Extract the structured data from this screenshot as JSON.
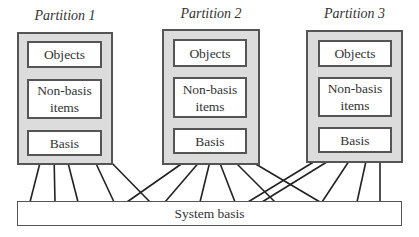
{
  "partitions": [
    {
      "title": "Partition 1",
      "objects": "Objects",
      "nonbasis": "Non-basis items",
      "basis": "Basis"
    },
    {
      "title": "Partition 2",
      "objects": "Objects",
      "nonbasis": "Non-basis items",
      "basis": "Basis"
    },
    {
      "title": "Partition 3",
      "objects": "Objects",
      "nonbasis": "Non-basis items",
      "basis": "Basis"
    }
  ],
  "system_basis": {
    "label": "System basis"
  },
  "colors": {
    "partition_fill": "#dcdcdc",
    "border": "#555555",
    "line": "#222222"
  }
}
